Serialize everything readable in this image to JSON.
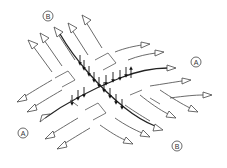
{
  "diagram": {
    "labels": {
      "b_top": "B",
      "a_right": "A",
      "a_left": "A",
      "b_bottom": "B"
    },
    "families": [
      {
        "name": "A",
        "direction": "lower-left to right",
        "arrow_count_right": 6,
        "arrow_count_left": 5
      },
      {
        "name": "B",
        "direction": "upper-left to lower-right",
        "arrow_count_top": 5,
        "arrow_count_bottom": 5
      }
    ],
    "colors": {
      "line": "#444444",
      "main_curve": "#222222",
      "background": "#ffffff"
    }
  }
}
